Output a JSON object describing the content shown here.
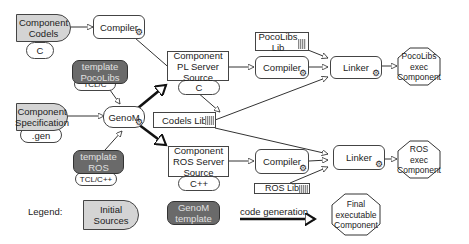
{
  "nodes": {
    "component_codels": {
      "label_l1": "Component",
      "label_l2": "Codels",
      "lang": "C"
    },
    "compiler_top": {
      "label": "Compiler"
    },
    "template_pocolibs": {
      "label_l1": "template",
      "label_l2": "PocoLibs",
      "lang": "TCL/C"
    },
    "component_spec": {
      "label_l1": "Component",
      "label_l2": "Specification",
      "lang": ".gen"
    },
    "genom": {
      "label": "GenoM"
    },
    "template_ros": {
      "label_l1": "template",
      "label_l2": "ROS",
      "lang": "TCL/C++"
    },
    "pl_server_source": {
      "label_l1": "Component",
      "label_l2": "PL Server",
      "label_l3": "Source",
      "lang": "C"
    },
    "codels_lib": {
      "label": "Codels Lib"
    },
    "ros_server_source": {
      "label_l1": "Component",
      "label_l2": "ROS Server",
      "label_l3": "Source",
      "lang": "C++"
    },
    "pocolibs_lib": {
      "label_l1": "PocoLibs",
      "label_l2": "Lib"
    },
    "compiler_pl": {
      "label": "Compiler"
    },
    "compiler_ros": {
      "label": "Compiler"
    },
    "ros_lib": {
      "label": "ROS Lib"
    },
    "linker_pl": {
      "label": "Linker"
    },
    "linker_ros": {
      "label": "Linker"
    },
    "pocolibs_exec": {
      "label_l1": "PocoLibs",
      "label_l2": "exec",
      "label_l3": "Component"
    },
    "ros_exec": {
      "label_l1": "ROS",
      "label_l2": "exec",
      "label_l3": "Component"
    }
  },
  "legend": {
    "title": "Legend:",
    "initial_sources": "Initial Sources",
    "genom_template_l1": "GenoM",
    "genom_template_l2": "template",
    "code_generation": "code generation",
    "final_l1": "Final",
    "final_l2": "executable",
    "final_l3": "Component"
  },
  "colors": {
    "source_fill": "#d4d4d4",
    "template_fill": "#6a6a6a",
    "stroke": "#333333"
  }
}
